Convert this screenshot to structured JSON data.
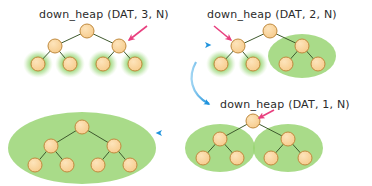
{
  "diagram": {
    "title_visible": false,
    "background_color": "#ffffff",
    "palette": {
      "node_fill": "#f8d39a",
      "node_stroke": "#c08a3e",
      "edge_stroke": "#3f5a2e",
      "highlight_fill": "#8fd06a",
      "highlight_glow": "#bfe6a0",
      "flow_arrow": "#1f93dd",
      "pointer_arrow": "#e8407f",
      "text_color": "#2b2b2b"
    },
    "captions": [
      {
        "id": "caption-step-3",
        "text": "down_heap (DAT, 3, N)",
        "x": 39,
        "y": 8
      },
      {
        "id": "caption-step-2",
        "text": "down_heap (DAT, 2, N)",
        "x": 207,
        "y": 8
      },
      {
        "id": "caption-step-1",
        "text": "down_heap (DAT, 1, N)",
        "x": 220,
        "y": 98
      }
    ],
    "panels": [
      {
        "id": "panel-step-3",
        "caption_ref": "caption-step-3",
        "nodes": [
          {
            "id": "n1",
            "cx": 87,
            "cy": 31,
            "r": 7
          },
          {
            "id": "n2",
            "cx": 55,
            "cy": 46,
            "r": 7
          },
          {
            "id": "n3",
            "cx": 119,
            "cy": 46,
            "r": 7
          },
          {
            "id": "n4",
            "cx": 38,
            "cy": 64,
            "r": 7
          },
          {
            "id": "n5",
            "cx": 70,
            "cy": 64,
            "r": 7
          },
          {
            "id": "n6",
            "cx": 103,
            "cy": 64,
            "r": 7
          },
          {
            "id": "n7",
            "cx": 135,
            "cy": 64,
            "r": 7
          }
        ],
        "edges": [
          [
            "n1",
            "n2"
          ],
          [
            "n1",
            "n3"
          ],
          [
            "n2",
            "n4"
          ],
          [
            "n2",
            "n5"
          ],
          [
            "n3",
            "n6"
          ],
          [
            "n3",
            "n7"
          ]
        ],
        "highlights": [
          {
            "id": "hl-leaf-1",
            "shape": "ellipse",
            "cx": 38,
            "cy": 64,
            "rx": 13,
            "ry": 12
          },
          {
            "id": "hl-leaf-2",
            "shape": "ellipse",
            "cx": 70,
            "cy": 64,
            "rx": 13,
            "ry": 12
          },
          {
            "id": "hl-leaf-3",
            "shape": "ellipse",
            "cx": 103,
            "cy": 64,
            "rx": 13,
            "ry": 12
          },
          {
            "id": "hl-leaf-4",
            "shape": "ellipse",
            "cx": 135,
            "cy": 64,
            "rx": 13,
            "ry": 12
          }
        ],
        "pointer": {
          "id": "pointer-step-3",
          "x1": 147,
          "y1": 26,
          "x2": 129,
          "y2": 40
        }
      },
      {
        "id": "panel-step-2",
        "caption_ref": "caption-step-2",
        "nodes": [
          {
            "id": "m1",
            "cx": 270,
            "cy": 31,
            "r": 7
          },
          {
            "id": "m2",
            "cx": 238,
            "cy": 46,
            "r": 7
          },
          {
            "id": "m3",
            "cx": 302,
            "cy": 46,
            "r": 7
          },
          {
            "id": "m4",
            "cx": 221,
            "cy": 64,
            "r": 7
          },
          {
            "id": "m5",
            "cx": 253,
            "cy": 64,
            "r": 7
          },
          {
            "id": "m6",
            "cx": 286,
            "cy": 64,
            "r": 7
          },
          {
            "id": "m7",
            "cx": 318,
            "cy": 64,
            "r": 7
          }
        ],
        "edges": [
          [
            "m1",
            "m2"
          ],
          [
            "m1",
            "m3"
          ],
          [
            "m2",
            "m4"
          ],
          [
            "m2",
            "m5"
          ],
          [
            "m3",
            "m6"
          ],
          [
            "m3",
            "m7"
          ]
        ],
        "highlights": [
          {
            "id": "hl-leaf-5",
            "shape": "ellipse",
            "cx": 221,
            "cy": 64,
            "rx": 13,
            "ry": 12
          },
          {
            "id": "hl-leaf-6",
            "shape": "ellipse",
            "cx": 253,
            "cy": 64,
            "rx": 13,
            "ry": 12
          },
          {
            "id": "hl-subtree-right",
            "shape": "ellipse",
            "cx": 302,
            "cy": 56,
            "rx": 34,
            "ry": 22
          }
        ],
        "pointer": {
          "id": "pointer-step-2",
          "x1": 214,
          "y1": 26,
          "x2": 231,
          "y2": 40
        }
      },
      {
        "id": "panel-step-1",
        "caption_ref": "caption-step-1",
        "nodes": [
          {
            "id": "p1",
            "cx": 253,
            "cy": 121,
            "r": 7
          },
          {
            "id": "p2",
            "cx": 220,
            "cy": 139,
            "r": 7
          },
          {
            "id": "p3",
            "cx": 288,
            "cy": 139,
            "r": 7
          },
          {
            "id": "p4",
            "cx": 203,
            "cy": 158,
            "r": 7
          },
          {
            "id": "p5",
            "cx": 237,
            "cy": 158,
            "r": 7
          },
          {
            "id": "p6",
            "cx": 271,
            "cy": 158,
            "r": 7
          },
          {
            "id": "p7",
            "cx": 305,
            "cy": 158,
            "r": 7
          }
        ],
        "edges": [
          [
            "p1",
            "p2"
          ],
          [
            "p1",
            "p3"
          ],
          [
            "p2",
            "p4"
          ],
          [
            "p2",
            "p5"
          ],
          [
            "p3",
            "p6"
          ],
          [
            "p3",
            "p7"
          ]
        ],
        "highlights": [
          {
            "id": "hl-subtree-left-2",
            "shape": "ellipse",
            "cx": 220,
            "cy": 148,
            "rx": 35,
            "ry": 24
          },
          {
            "id": "hl-subtree-right-2",
            "shape": "ellipse",
            "cx": 288,
            "cy": 148,
            "rx": 35,
            "ry": 24
          }
        ],
        "pointer": {
          "id": "pointer-step-1",
          "x1": 274,
          "y1": 110,
          "x2": 259,
          "y2": 118
        }
      },
      {
        "id": "panel-result",
        "caption_ref": null,
        "nodes": [
          {
            "id": "r1",
            "cx": 82,
            "cy": 127,
            "r": 7
          },
          {
            "id": "r2",
            "cx": 51,
            "cy": 146,
            "r": 7
          },
          {
            "id": "r3",
            "cx": 114,
            "cy": 146,
            "r": 7
          },
          {
            "id": "r4",
            "cx": 35,
            "cy": 165,
            "r": 7
          },
          {
            "id": "r5",
            "cx": 67,
            "cy": 165,
            "r": 7
          },
          {
            "id": "r6",
            "cx": 98,
            "cy": 165,
            "r": 7
          },
          {
            "id": "r7",
            "cx": 130,
            "cy": 165,
            "r": 7
          }
        ],
        "edges": [
          [
            "r1",
            "r2"
          ],
          [
            "r1",
            "r3"
          ],
          [
            "r2",
            "r4"
          ],
          [
            "r2",
            "r5"
          ],
          [
            "r3",
            "r6"
          ],
          [
            "r3",
            "r7"
          ]
        ],
        "highlights": [
          {
            "id": "hl-whole-heap",
            "shape": "ellipse",
            "cx": 82,
            "cy": 148,
            "rx": 74,
            "ry": 36
          }
        ],
        "pointer": null
      }
    ],
    "flow_arrows": [
      {
        "id": "flow-arrow-right",
        "kind": "straight",
        "x1": 163,
        "y1": 45,
        "x2": 210,
        "y2": 45
      },
      {
        "id": "flow-arrow-curved-down",
        "kind": "curved",
        "path": "M 196 62 C 188 76 190 94 209 104"
      },
      {
        "id": "flow-arrow-left",
        "kind": "straight",
        "x1": 201,
        "y1": 133,
        "x2": 157,
        "y2": 133
      }
    ]
  }
}
